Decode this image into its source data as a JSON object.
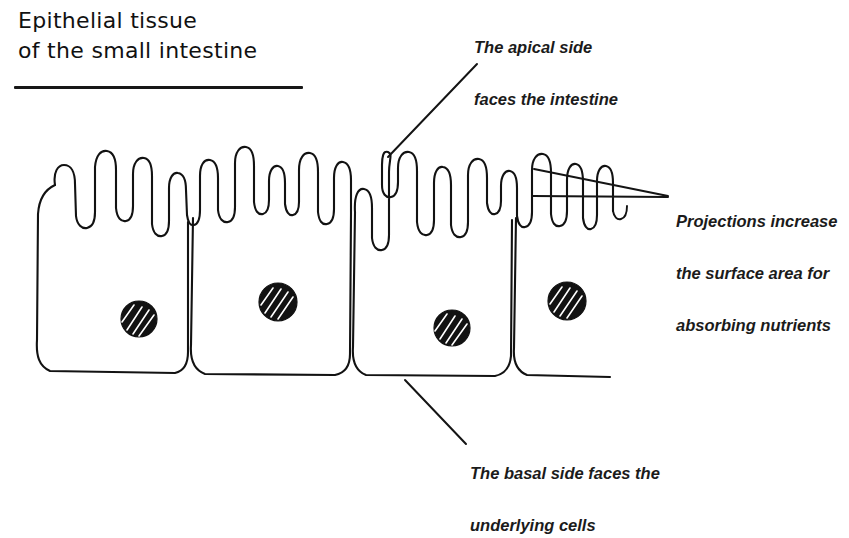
{
  "figure": {
    "title_line1": "Epithelial tissue",
    "title_line2": "of the small intestine",
    "background_color": "#ffffff",
    "ink_color": "#121212"
  },
  "annotations": {
    "apical": {
      "text": "The apical side\nfaces the intestine",
      "line1": "The apical side",
      "line2": "faces the intestine"
    },
    "projections": {
      "text": "Projections increase\nthe surface area for\nabsorbing nutrients",
      "line1": "Projections increase",
      "line2": "the surface area for",
      "line3": "absorbing nutrients"
    },
    "basal": {
      "text": "The basal side faces the\nunderlying cells",
      "line1": "The basal side faces the",
      "line2": "underlying cells"
    }
  },
  "cells": {
    "count": 4,
    "feature_labels": {
      "microvilli": "microvilli projections",
      "nucleus": "nucleus",
      "apical_surface": "apical surface",
      "basal_surface": "basal surface",
      "lateral_membrane": "lateral cell membrane"
    }
  }
}
